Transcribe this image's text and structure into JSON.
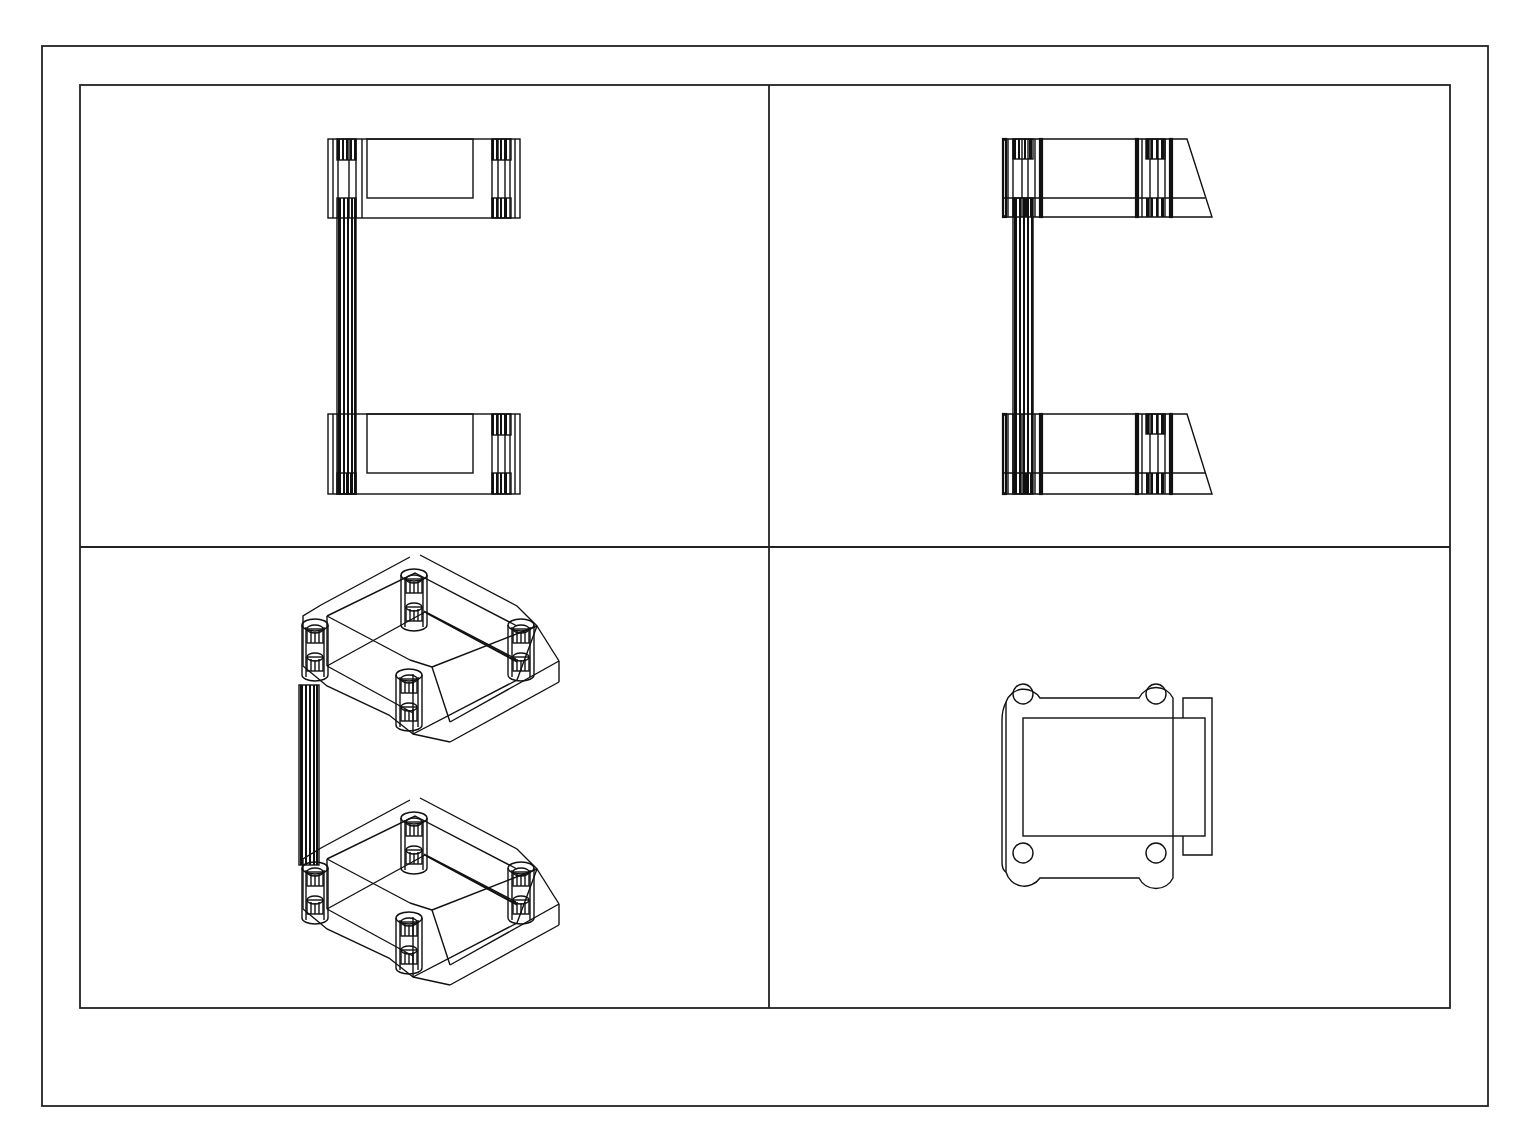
{
  "drawing": {
    "type": "multiview-cad-drawing",
    "layout": "2x2 viewports",
    "line_color": "#111111",
    "background_color": "#ffffff",
    "outer_frame": {
      "x": 42,
      "y": 46,
      "width": 1446,
      "height": 1060
    },
    "inner_frame": {
      "x": 80,
      "y": 85,
      "width": 1370,
      "height": 923
    },
    "divider": {
      "x": 769,
      "y": 547
    },
    "views": [
      {
        "id": "top-left",
        "name": "top view",
        "description": "C-shaped bracket, plan view with two flanges and vertical post"
      },
      {
        "id": "top-right",
        "name": "front view",
        "description": "C-shaped bracket, elevation with tapered flange ends"
      },
      {
        "id": "bottom-left",
        "name": "isometric view",
        "description": "3D wireframe of C-shaped bracket with cylindrical bosses"
      },
      {
        "id": "bottom-right",
        "name": "side view",
        "description": "Flange outline with four rounded bolt-hole lugs"
      }
    ],
    "footer_caption": ""
  }
}
